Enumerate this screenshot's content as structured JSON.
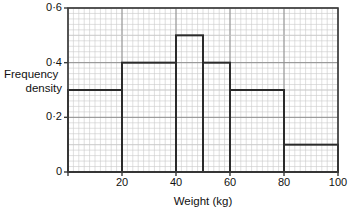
{
  "chart_data": {
    "type": "bar",
    "title": "",
    "xlabel": "Weight (kg)",
    "ylabel_line1": "Frequency",
    "ylabel_line2": "density",
    "xlim": [
      0,
      100
    ],
    "ylim": [
      0,
      0.6
    ],
    "grid": true,
    "legend": "none",
    "bin_edges": [
      0,
      20,
      40,
      50,
      60,
      80,
      100
    ],
    "values": [
      0.3,
      0.4,
      0.5,
      0.4,
      0.3,
      0.1
    ],
    "bars": [
      {
        "x0": 0,
        "x1": 20,
        "height": 0.3
      },
      {
        "x0": 20,
        "x1": 40,
        "height": 0.4
      },
      {
        "x0": 40,
        "x1": 50,
        "height": 0.5
      },
      {
        "x0": 50,
        "x1": 60,
        "height": 0.4
      },
      {
        "x0": 60,
        "x1": 80,
        "height": 0.3
      },
      {
        "x0": 80,
        "x1": 100,
        "height": 0.1
      }
    ],
    "xticks": [
      {
        "value": 0,
        "label": ""
      },
      {
        "value": 20,
        "label": "20"
      },
      {
        "value": 40,
        "label": "40"
      },
      {
        "value": 60,
        "label": "60"
      },
      {
        "value": 80,
        "label": "80"
      },
      {
        "value": 100,
        "label": "100"
      }
    ],
    "yticks": [
      {
        "value": 0,
        "label": "0"
      },
      {
        "value": 0.2,
        "label": "0·2"
      },
      {
        "value": 0.4,
        "label": "0·4"
      },
      {
        "value": 0.6,
        "label": "0·6"
      }
    ],
    "colors": {
      "bar_outline": "#2b2b2b",
      "bar_fill": "none",
      "major_grid": "#8e8e8e",
      "minor_grid": "#c9c9c9",
      "axis": "#3a3a3a",
      "text": "#111111",
      "background": "#ffffff"
    }
  }
}
